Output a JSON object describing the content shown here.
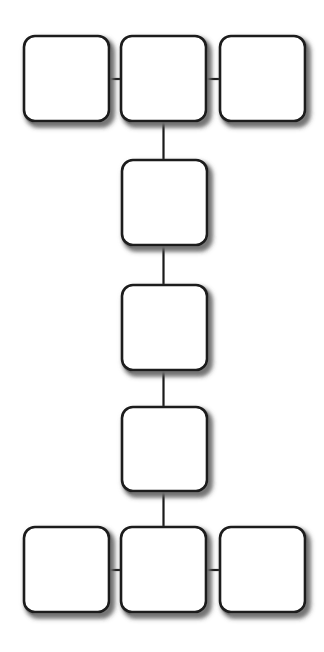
{
  "diagram": {
    "canvas": {
      "width": 324,
      "height": 652,
      "background": "#ffffff"
    },
    "style": {
      "node_fill": "#ffffff",
      "node_stroke": "#1a1a1a",
      "node_stroke_width": 2.6,
      "node_corner_radius": 11,
      "shadow_color": "#8c8c8c",
      "shadow_blur": 5,
      "shadow_offset_x": 2.5,
      "shadow_offset_y": 3,
      "edge_stroke": "#1a1a1a",
      "edge_stroke_width": 2.2
    },
    "nodes": [
      {
        "id": "n1",
        "label": "",
        "row": "top",
        "column": "left",
        "x": 24,
        "y": 36,
        "w": 85,
        "h": 85
      },
      {
        "id": "n2",
        "label": "",
        "row": "top",
        "column": "center",
        "x": 121,
        "y": 36,
        "w": 85,
        "h": 85
      },
      {
        "id": "n3",
        "label": "",
        "row": "top",
        "column": "right",
        "x": 220,
        "y": 36,
        "w": 85,
        "h": 85
      },
      {
        "id": "n4",
        "label": "",
        "row": "2",
        "column": "center",
        "x": 122,
        "y": 160,
        "w": 85,
        "h": 85
      },
      {
        "id": "n5",
        "label": "",
        "row": "3",
        "column": "center",
        "x": 122,
        "y": 285,
        "w": 85,
        "h": 85
      },
      {
        "id": "n6",
        "label": "",
        "row": "4",
        "column": "center",
        "x": 122,
        "y": 407,
        "w": 85,
        "h": 84
      },
      {
        "id": "n7",
        "label": "",
        "row": "bottom",
        "column": "left",
        "x": 24,
        "y": 527,
        "w": 85,
        "h": 85
      },
      {
        "id": "n8",
        "label": "",
        "row": "bottom",
        "column": "center",
        "x": 121,
        "y": 527,
        "w": 85,
        "h": 85
      },
      {
        "id": "n9",
        "label": "",
        "row": "bottom",
        "column": "right",
        "x": 220,
        "y": 527,
        "w": 85,
        "h": 85
      }
    ],
    "edges": [
      {
        "id": "e1",
        "from": "n1",
        "to": "n2",
        "orientation": "horizontal",
        "x1": 109,
        "y1": 79,
        "x2": 122,
        "y2": 79
      },
      {
        "id": "e2",
        "from": "n2",
        "to": "n3",
        "orientation": "horizontal",
        "x1": 207,
        "y1": 79,
        "x2": 221,
        "y2": 79
      },
      {
        "id": "e3",
        "from": "n2",
        "to": "n4",
        "orientation": "vertical",
        "x1": 163.5,
        "y1": 120,
        "x2": 163.5,
        "y2": 161
      },
      {
        "id": "e4",
        "from": "n4",
        "to": "n5",
        "orientation": "vertical",
        "x1": 163.5,
        "y1": 244,
        "x2": 163.5,
        "y2": 286
      },
      {
        "id": "e5",
        "from": "n5",
        "to": "n6",
        "orientation": "vertical",
        "x1": 163.5,
        "y1": 369,
        "x2": 163.5,
        "y2": 408
      },
      {
        "id": "e6",
        "from": "n6",
        "to": "n8",
        "orientation": "vertical",
        "x1": 163.5,
        "y1": 490,
        "x2": 163.5,
        "y2": 528
      },
      {
        "id": "e7",
        "from": "n7",
        "to": "n8",
        "orientation": "horizontal",
        "x1": 109,
        "y1": 570,
        "x2": 122,
        "y2": 570
      },
      {
        "id": "e8",
        "from": "n8",
        "to": "n9",
        "orientation": "horizontal",
        "x1": 207,
        "y1": 570,
        "x2": 221,
        "y2": 570
      }
    ]
  }
}
